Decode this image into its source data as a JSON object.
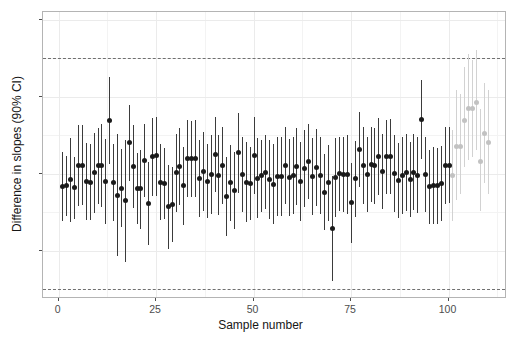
{
  "chart_data": {
    "type": "scatter",
    "title": "",
    "xlabel": "Sample number",
    "ylabel": "Difference in slopes (90% CI)",
    "xlim": [
      -4,
      115
    ],
    "ylim": [
      -0.163,
      0.21
    ],
    "grid": true,
    "legend": null,
    "x_ticks": [
      0,
      25,
      50,
      75,
      100
    ],
    "x_tick_labels": [
      "0",
      "25",
      "50",
      "75",
      "100"
    ],
    "y_ticks": [
      -0.1,
      0.0,
      0.1,
      0.2
    ],
    "y_tick_labels": [
      "-0.1",
      "0.0",
      "0.1",
      "0.2"
    ],
    "reference_lines": [
      {
        "y": 0.15,
        "style": "dashed",
        "color": "#707070"
      },
      {
        "y": -0.15,
        "style": "dashed",
        "color": "#707070"
      }
    ],
    "series": [
      {
        "name": "Resampled estimates",
        "color": "#1a1a1a",
        "x": [
          1,
          2,
          3,
          4,
          5,
          6,
          7,
          8,
          9,
          10,
          11,
          12,
          13,
          14,
          15,
          16,
          17,
          18,
          19,
          20,
          21,
          22,
          23,
          24,
          25,
          26,
          27,
          28,
          29,
          30,
          31,
          32,
          33,
          34,
          35,
          36,
          37,
          38,
          39,
          40,
          41,
          42,
          43,
          44,
          45,
          46,
          47,
          48,
          49,
          50,
          51,
          52,
          53,
          54,
          55,
          56,
          57,
          58,
          59,
          60,
          61,
          62,
          63,
          64,
          65,
          66,
          67,
          68,
          69,
          70,
          71,
          72,
          73,
          74,
          75,
          76,
          77,
          78,
          79,
          80,
          81,
          82,
          83,
          84,
          85,
          86,
          87,
          88,
          89,
          90,
          91,
          92,
          93,
          94,
          95,
          96,
          97,
          98,
          99,
          100
        ],
        "y": [
          -0.017,
          -0.016,
          -0.008,
          -0.018,
          0.011,
          0.011,
          -0.01,
          -0.011,
          0.001,
          0.01,
          0.011,
          -0.01,
          0.069,
          -0.012,
          -0.028,
          -0.019,
          -0.035,
          0.04,
          0.009,
          -0.019,
          -0.02,
          0.017,
          -0.039,
          0.022,
          0.023,
          -0.011,
          -0.013,
          -0.043,
          -0.04,
          0.001,
          0.009,
          -0.016,
          0.019,
          0.019,
          0.019,
          -0.007,
          0.003,
          -0.01,
          -0.001,
          0.025,
          -0.002,
          0.011,
          -0.03,
          -0.012,
          -0.022,
          0.027,
          -0.001,
          -0.011,
          -0.013,
          0.023,
          -0.006,
          -0.003,
          0.002,
          -0.008,
          -0.014,
          -0.004,
          -0.004,
          0.011,
          -0.005,
          -0.003,
          0.009,
          -0.01,
          0.006,
          0.016,
          -0.004,
          0.008,
          -0.002,
          -0.024,
          -0.012,
          -0.071,
          -0.005,
          0.0,
          -0.001,
          -0.001,
          -0.038,
          -0.007,
          0.031,
          0.011,
          -0.001,
          0.012,
          0.01,
          0.022,
          0.003,
          0.022,
          0.022,
          0.0,
          -0.009,
          -0.002,
          0.001,
          -0.008,
          0.002,
          -0.002,
          0.07,
          -0.001,
          -0.017,
          -0.016,
          -0.016,
          -0.013,
          0.01,
          0.011
        ],
        "ylo": [
          -0.062,
          -0.055,
          -0.063,
          -0.059,
          -0.042,
          -0.041,
          -0.06,
          -0.06,
          -0.051,
          -0.039,
          -0.043,
          -0.065,
          0.013,
          -0.062,
          -0.107,
          -0.07,
          -0.115,
          -0.01,
          -0.045,
          -0.065,
          -0.072,
          -0.031,
          -0.093,
          -0.029,
          -0.029,
          -0.06,
          -0.059,
          -0.098,
          -0.089,
          -0.05,
          -0.041,
          -0.067,
          -0.031,
          -0.03,
          -0.031,
          -0.057,
          -0.048,
          -0.058,
          -0.052,
          -0.024,
          -0.054,
          -0.039,
          -0.081,
          -0.061,
          -0.072,
          -0.025,
          -0.05,
          -0.063,
          -0.06,
          -0.027,
          -0.058,
          -0.05,
          -0.046,
          -0.059,
          -0.066,
          -0.055,
          -0.055,
          -0.039,
          -0.055,
          -0.053,
          -0.041,
          -0.061,
          -0.044,
          -0.033,
          -0.054,
          -0.042,
          -0.052,
          -0.073,
          -0.061,
          -0.139,
          -0.056,
          -0.048,
          -0.05,
          -0.052,
          -0.09,
          -0.056,
          -0.018,
          -0.039,
          -0.05,
          -0.037,
          -0.039,
          -0.028,
          -0.046,
          -0.026,
          -0.027,
          -0.05,
          -0.058,
          -0.052,
          -0.049,
          -0.057,
          -0.047,
          -0.051,
          0.019,
          -0.05,
          -0.065,
          -0.066,
          -0.065,
          -0.062,
          -0.04,
          -0.038
        ],
        "yhi": [
          0.028,
          0.023,
          0.046,
          0.022,
          0.063,
          0.063,
          0.04,
          0.038,
          0.053,
          0.059,
          0.064,
          0.045,
          0.126,
          0.038,
          0.051,
          0.032,
          0.044,
          0.089,
          0.063,
          0.027,
          0.031,
          0.065,
          0.015,
          0.072,
          0.074,
          0.038,
          0.033,
          0.011,
          0.009,
          0.051,
          0.059,
          0.035,
          0.069,
          0.068,
          0.069,
          0.043,
          0.054,
          0.038,
          0.05,
          0.074,
          0.05,
          0.061,
          0.021,
          0.037,
          0.028,
          0.079,
          0.048,
          0.041,
          0.034,
          0.073,
          0.046,
          0.044,
          0.05,
          0.043,
          0.038,
          0.047,
          0.047,
          0.061,
          0.045,
          0.047,
          0.059,
          0.041,
          0.056,
          0.065,
          0.046,
          0.058,
          0.048,
          0.025,
          0.037,
          -0.003,
          0.046,
          0.048,
          0.048,
          0.05,
          0.014,
          0.042,
          0.08,
          0.061,
          0.048,
          0.061,
          0.059,
          0.072,
          0.052,
          0.07,
          0.071,
          0.05,
          0.04,
          0.048,
          0.051,
          0.041,
          0.051,
          0.047,
          0.121,
          0.048,
          0.031,
          0.034,
          0.033,
          0.036,
          0.06,
          0.06
        ]
      },
      {
        "name": "Extrapolated estimates",
        "color": "#c2c2c2",
        "x": [
          101,
          102,
          103,
          104,
          105,
          106,
          107,
          108,
          109,
          110
        ],
        "y": [
          -0.003,
          0.035,
          0.035,
          0.069,
          0.084,
          0.084,
          0.093,
          0.016,
          0.052,
          0.04
        ],
        "ylo": [
          -0.062,
          -0.035,
          -0.027,
          0.008,
          0.018,
          0.022,
          0.03,
          -0.048,
          -0.012,
          -0.026
        ],
        "yhi": [
          0.056,
          0.108,
          0.103,
          0.138,
          0.155,
          0.148,
          0.16,
          0.084,
          0.118,
          0.108
        ]
      }
    ]
  }
}
